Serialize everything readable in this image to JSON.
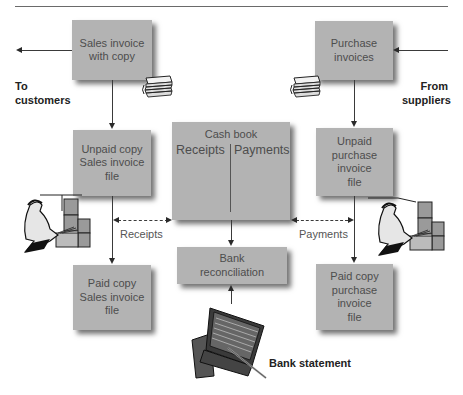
{
  "boxes": {
    "sales_invoice": "Sales invoice\nwith copy",
    "purchase_invoices": "Purchase\ninvoices",
    "unpaid_sales": "Unpaid copy\nSales invoice\nfile",
    "unpaid_purchase": "Unpaid\npurchase\ninvoice\nfile",
    "paid_sales": "Paid copy\nSales invoice\nfile",
    "paid_purchase": "Paid copy\npurchase\ninvoice\nfile",
    "bank_reconciliation": "Bank\nreconciliation"
  },
  "cash_book": {
    "title": "Cash book",
    "left_col": "Receipts",
    "right_col": "Payments"
  },
  "labels": {
    "to_customers": "To\ncustomers",
    "from_suppliers": "From\nsuppliers",
    "receipts": "Receipts",
    "payments": "Payments",
    "bank_statement": "Bank statement"
  },
  "icons": [
    "paper-stack-icon",
    "filing-clerk-icon",
    "bank-statement-book-icon"
  ],
  "colors": {
    "box_fill": "#b3b3b3",
    "box_text": "#4d4d4d",
    "line": "#3a3a3a"
  }
}
